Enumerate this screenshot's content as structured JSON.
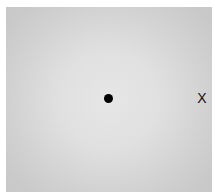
{
  "figure": {
    "background_color": "#ffffff",
    "patch": {
      "center_color": "#e6e6e6",
      "edge_color": "#c9c9c9"
    },
    "fixation_dot": {
      "color": "#000000"
    },
    "target_marker": {
      "label": "X",
      "color": "#111111"
    }
  }
}
